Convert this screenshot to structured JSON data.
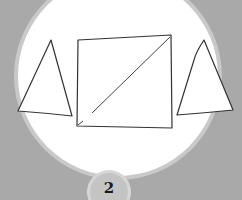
{
  "illustration": {
    "background_color": "#a9a9a9",
    "circle": {
      "fill": "#ffffff",
      "ring_color": "#c9c9c9",
      "cx": 118,
      "cy": 76,
      "r": 100
    },
    "shapes": [
      {
        "type": "triangle",
        "name": "left-triangle",
        "points": [
          [
            51,
            40
          ],
          [
            18,
            111
          ],
          [
            72,
            116
          ]
        ]
      },
      {
        "type": "square",
        "name": "square-with-diagonal",
        "points": [
          [
            78,
            40
          ],
          [
            171,
            35
          ],
          [
            172,
            128
          ],
          [
            77,
            126
          ]
        ],
        "diagonal": [
          [
            92,
            113
          ],
          [
            170,
            37
          ]
        ]
      },
      {
        "type": "triangle",
        "name": "right-triangle",
        "points": [
          [
            204,
            40
          ],
          [
            177,
            115
          ],
          [
            233,
            110
          ]
        ]
      }
    ],
    "stroke_color": "#333333"
  },
  "badge": {
    "label": "2",
    "fill": "#c4c4c4",
    "ring_color": "#d6d6d6"
  }
}
